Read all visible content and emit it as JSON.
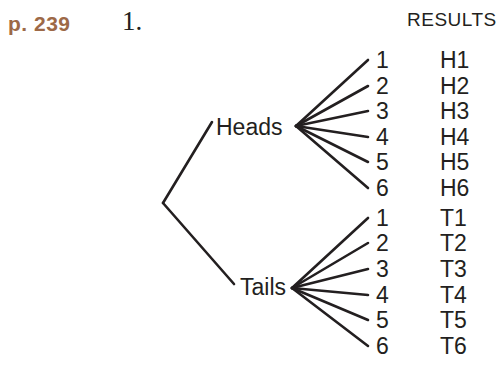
{
  "page": {
    "page_ref": "p. 239",
    "problem_number": "1.",
    "results_header": "RESULTS"
  },
  "colors": {
    "page_ref": "#9d6947",
    "ink": "#231f20",
    "background": "#ffffff"
  },
  "tree": {
    "type": "tree-diagram",
    "description": "Probability tree: coin flip (Heads/Tails) followed by die roll (1-6)",
    "branches": [
      {
        "label": "Heads",
        "outcomes": [
          "1",
          "2",
          "3",
          "4",
          "5",
          "6"
        ],
        "results": [
          "H1",
          "H2",
          "H3",
          "H4",
          "H5",
          "H6"
        ]
      },
      {
        "label": "Tails",
        "outcomes": [
          "1",
          "2",
          "3",
          "4",
          "5",
          "6"
        ],
        "results": [
          "T1",
          "T2",
          "T3",
          "T4",
          "T5",
          "T6"
        ]
      }
    ]
  }
}
